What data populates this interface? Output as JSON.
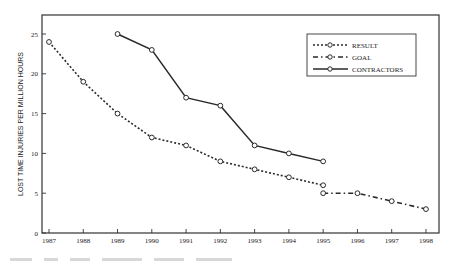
{
  "chart_data": {
    "type": "line",
    "title": "",
    "xlabel": "",
    "ylabel": "LOST TIME INJURIES PER MILLION HOURS",
    "x": [
      1987,
      1988,
      1989,
      1990,
      1991,
      1992,
      1993,
      1994,
      1995,
      1996,
      1997,
      1998
    ],
    "x_tick_labels": [
      "1987",
      "1988",
      "1989",
      "1990",
      "1991",
      "1992",
      "1993",
      "1994",
      "1995",
      "1996",
      "1997",
      "1998"
    ],
    "y_ticks": [
      0,
      5,
      10,
      15,
      20,
      25
    ],
    "y_tick_labels": [
      "0",
      "5",
      "10",
      "15",
      "20",
      "25"
    ],
    "ylim": [
      0,
      28.5
    ],
    "grid": false,
    "legend_position": "upper right",
    "series": [
      {
        "name": "RESULT",
        "style": "dotted",
        "x": [
          1987,
          1988,
          1989,
          1990,
          1991,
          1992,
          1993,
          1994,
          1995
        ],
        "values": [
          24,
          19,
          15,
          12,
          11,
          9,
          8,
          7,
          6
        ]
      },
      {
        "name": "GOAL",
        "style": "dash-dot",
        "x": [
          1995,
          1996,
          1997,
          1998
        ],
        "values": [
          5,
          5,
          4,
          3
        ]
      },
      {
        "name": "CONTRACTORS",
        "style": "solid",
        "x": [
          1989,
          1990,
          1991,
          1992,
          1993,
          1994,
          1995
        ],
        "values": [
          25,
          23,
          17,
          16,
          11,
          10,
          9
        ]
      }
    ]
  },
  "colors": {
    "line": "#2a2a2a",
    "frame": "#333333",
    "background": "#ffffff"
  }
}
